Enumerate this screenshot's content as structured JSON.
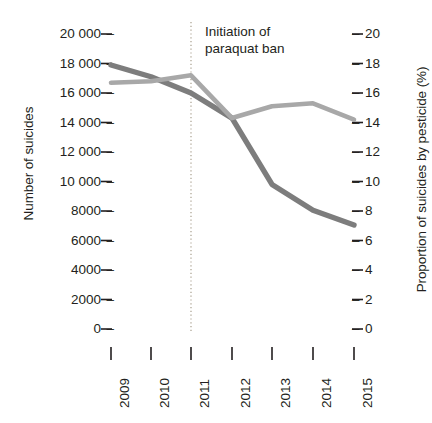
{
  "chart_data": {
    "type": "line",
    "title": "",
    "xlabel": "",
    "ylabel": "Number of suicides",
    "y2label": "Proportion of suicides by pesticide (%)",
    "categories": [
      "2009",
      "2010",
      "2011",
      "2012",
      "2013",
      "2014",
      "2015"
    ],
    "x": [
      2009,
      2010,
      2011,
      2012,
      2013,
      2014,
      2015
    ],
    "ylim": [
      0,
      20000
    ],
    "y2lim": [
      0,
      20
    ],
    "grid": false,
    "legend": "none",
    "series": [
      {
        "name": "Number of suicides",
        "axis": "left",
        "color": "#7d7d7d",
        "values": [
          17900,
          17100,
          16000,
          14300,
          9800,
          8050,
          7050
        ]
      },
      {
        "name": "Proportion of suicides by pesticide (%)",
        "axis": "right",
        "color": "#a8a8a8",
        "values": [
          16.7,
          16.8,
          17.2,
          14.3,
          15.1,
          15.3,
          14.2
        ]
      }
    ],
    "annotations": [
      {
        "text": "Initiation of\nparaquat ban",
        "x": 2011,
        "type": "vertical-dotted-line-with-label",
        "line_color": "#b5ad9e"
      }
    ],
    "left_axis_ticks": [
      "20 000",
      "18 000",
      "16 000",
      "14 000",
      "12 000",
      "10 000",
      "8000",
      "6000",
      "4000",
      "2000",
      "0"
    ],
    "left_axis_values": [
      20000,
      18000,
      16000,
      14000,
      12000,
      10000,
      8000,
      6000,
      4000,
      2000,
      0
    ],
    "right_axis_ticks": [
      "20",
      "18",
      "16",
      "14",
      "12",
      "10",
      "8",
      "6",
      "4",
      "2",
      "0"
    ],
    "right_axis_values": [
      20,
      18,
      16,
      14,
      12,
      10,
      8,
      6,
      4,
      2,
      0
    ],
    "tick_dash": "–"
  }
}
